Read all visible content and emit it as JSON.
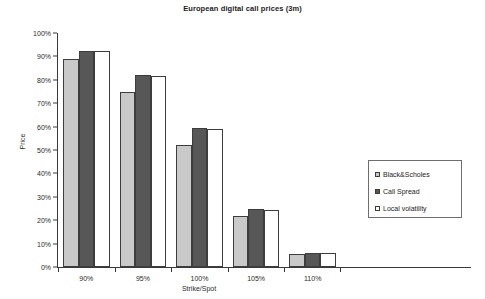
{
  "chart_data": {
    "type": "bar",
    "title": "European digital call prices (3m)",
    "xlabel": "Strike/Spot",
    "ylabel": "Price",
    "categories": [
      "90%",
      "95%",
      "100%",
      "105%",
      "110%"
    ],
    "series": [
      {
        "name": "Black&Scholes",
        "color": "#c9c9c9",
        "values": [
          89,
          75,
          52,
          22,
          5.5
        ]
      },
      {
        "name": "Call Spread",
        "color": "#575757",
        "values": [
          92.5,
          82,
          59.5,
          25,
          6
        ]
      },
      {
        "name": "Local volatility",
        "color": "#ffffff",
        "values": [
          92.5,
          81.5,
          59,
          24.5,
          6
        ]
      }
    ],
    "ylim": [
      0,
      100
    ],
    "ytick_labels": [
      "0%",
      "10%",
      "20%",
      "30%",
      "40%",
      "50%",
      "60%",
      "70%",
      "80%",
      "90%",
      "100%"
    ],
    "ytick_values": [
      0,
      10,
      20,
      30,
      40,
      50,
      60,
      70,
      80,
      90,
      100
    ],
    "grid": false,
    "legend_position": "right-middle"
  },
  "legend": {
    "items": [
      {
        "label": "Black&Scholes"
      },
      {
        "label": "Call Spread"
      },
      {
        "label": "Local volatility"
      }
    ]
  }
}
